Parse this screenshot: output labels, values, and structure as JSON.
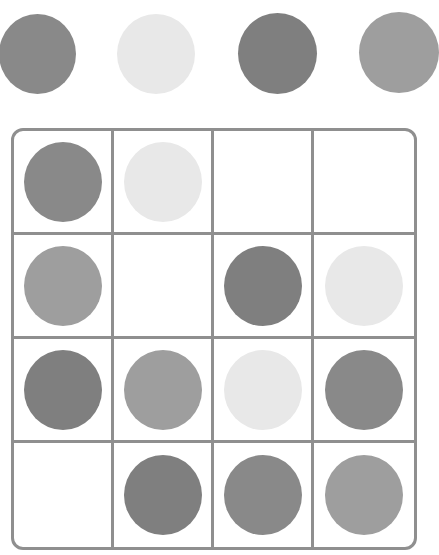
{
  "colors": {
    "dark": "#7f7f7f",
    "medium_dark": "#898989",
    "medium": "#9e9e9e",
    "light": "#e8e8e8",
    "border": "#8f8f8f",
    "background": "#ffffff"
  },
  "top_row": {
    "circles": [
      {
        "shade": "medium_dark",
        "color": "#898989"
      },
      {
        "shade": "light",
        "color": "#e8e8e8"
      },
      {
        "shade": "dark",
        "color": "#7f7f7f"
      },
      {
        "shade": "medium",
        "color": "#9e9e9e"
      }
    ]
  },
  "grid": {
    "rows": 4,
    "columns": 4,
    "cells": [
      [
        {
          "shade": "medium_dark",
          "color": "#898989"
        },
        {
          "shade": "light",
          "color": "#e8e8e8"
        },
        {
          "shade": "empty",
          "color": null
        },
        {
          "shade": "empty",
          "color": null
        }
      ],
      [
        {
          "shade": "medium",
          "color": "#9e9e9e"
        },
        {
          "shade": "empty",
          "color": null
        },
        {
          "shade": "dark",
          "color": "#7f7f7f"
        },
        {
          "shade": "light",
          "color": "#e8e8e8"
        }
      ],
      [
        {
          "shade": "dark",
          "color": "#7f7f7f"
        },
        {
          "shade": "medium",
          "color": "#9e9e9e"
        },
        {
          "shade": "light",
          "color": "#e8e8e8"
        },
        {
          "shade": "medium_dark",
          "color": "#898989"
        }
      ],
      [
        {
          "shade": "empty",
          "color": null
        },
        {
          "shade": "dark",
          "color": "#7f7f7f"
        },
        {
          "shade": "medium_dark",
          "color": "#898989"
        },
        {
          "shade": "medium",
          "color": "#9e9e9e"
        }
      ]
    ]
  }
}
